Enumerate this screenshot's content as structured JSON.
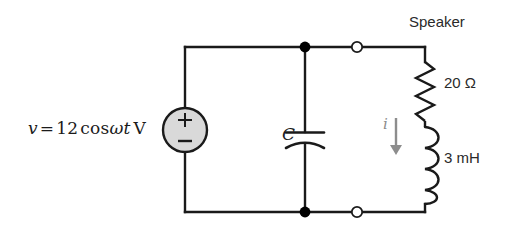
{
  "figure": {
    "type": "schematic-circuit"
  },
  "source": {
    "name": "voltage-source",
    "equation_text": "v = 12 cos ωt V",
    "variable": "v",
    "equals": "=",
    "amplitude": "12",
    "function": "cos",
    "omega": "ω",
    "time": "t",
    "unit": "V",
    "plus_sign": "+",
    "minus_sign": "−",
    "fill_color": "#d9d9d9",
    "stroke_color": "#1a1a1a"
  },
  "capacitor": {
    "name": "capacitor",
    "label": "C",
    "style": "curved-plate"
  },
  "speaker": {
    "label": "Speaker",
    "resistor": {
      "label": "20 Ω",
      "value": "20",
      "unit": "Ω"
    },
    "inductor": {
      "label": "3 mH",
      "value": "3",
      "unit": "mH"
    }
  },
  "current": {
    "label": "i",
    "direction": "down",
    "color": "#8d8d8d"
  },
  "terminals": {
    "top": "open-terminal-top",
    "bottom": "open-terminal-bottom",
    "fill": "#ffffff",
    "stroke": "#1a1a1a"
  },
  "nodes": {
    "top_junction": "node-top",
    "bottom_junction": "node-bottom",
    "fill": "#000000"
  },
  "wire": {
    "color": "#1a1a1a",
    "width": "2.4"
  },
  "background": "#ffffff"
}
